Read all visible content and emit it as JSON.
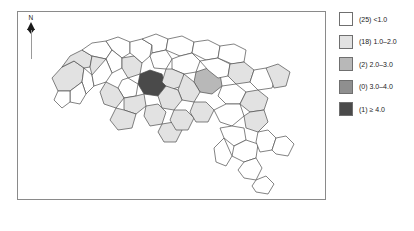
{
  "figure": {
    "type": "choropleth-map",
    "region": "South Carolina counties"
  },
  "north_arrow": {
    "label": "N",
    "icon": "north-arrow-icon"
  },
  "legend": {
    "position": "right",
    "rows": [
      {
        "count": "(25)",
        "range": "<1.0",
        "label": "(25) <1.0",
        "color": "#ffffff"
      },
      {
        "count": "(18)",
        "range": "1.0–2.0",
        "label": "(18) 1.0–2.0",
        "color": "#e2e2e2"
      },
      {
        "count": "(2)",
        "range": "2.0–3.0",
        "label": "(2) 2.0–3.0",
        "color": "#b8b8b8"
      },
      {
        "count": "(0)",
        "range": "3.0–4.0",
        "label": "(0) 3.0–4.0",
        "color": "#8f8f8f"
      },
      {
        "count": "(1)",
        "range": "≥ 4.0",
        "label": "(1) ≥ 4.0",
        "color": "#4a4a4a"
      }
    ]
  },
  "chart_data": {
    "type": "map",
    "title": "",
    "xlabel": "",
    "ylabel": "",
    "classes": [
      {
        "bin": "<1.0",
        "count": 25,
        "color": "#ffffff"
      },
      {
        "bin": "1.0–2.0",
        "count": 18,
        "color": "#e2e2e2"
      },
      {
        "bin": "2.0–3.0",
        "count": 2,
        "color": "#b8b8b8"
      },
      {
        "bin": "3.0–4.0",
        "count": 0,
        "color": "#8f8f8f"
      },
      {
        "bin": "≥ 4.0",
        "count": 1,
        "color": "#4a4a4a"
      }
    ],
    "total_units": 46,
    "legend_position": "right",
    "grid": false
  },
  "map": {
    "border_color": "#8a8a8a",
    "polygon_stroke": "#4d4d4d",
    "features": [
      {
        "id": "c01",
        "class": 1,
        "points": "34,66 44,55 56,49 66,56 64,70 52,79 40,79"
      },
      {
        "id": "c02",
        "class": 1,
        "points": "44,55 52,44 64,38 74,44 72,55 66,56 56,49"
      },
      {
        "id": "c03",
        "class": 0,
        "points": "64,38 74,31 88,29 94,38 88,47 74,44"
      },
      {
        "id": "c04",
        "class": 1,
        "points": "74,44 88,47 94,55 88,64 74,63 72,55"
      },
      {
        "id": "c05",
        "class": 0,
        "points": "66,56 74,63 76,74 68,82 64,70"
      },
      {
        "id": "c06",
        "class": 0,
        "points": "64,70 68,82 62,92 52,90 52,79"
      },
      {
        "id": "c07",
        "class": 0,
        "points": "52,79 52,90 44,96 36,88 40,79"
      },
      {
        "id": "c08",
        "class": 0,
        "points": "88,29 100,25 112,30 112,41 104,46 94,38"
      },
      {
        "id": "c09",
        "class": 0,
        "points": "94,38 104,46 104,56 94,61 88,47"
      },
      {
        "id": "c10",
        "class": 0,
        "points": "88,47 94,61 88,70 76,74 74,63"
      },
      {
        "id": "c11",
        "class": 1,
        "points": "104,46 116,44 124,51 122,62 110,66 104,56"
      },
      {
        "id": "c12",
        "class": 0,
        "points": "112,30 124,27 134,33 132,44 124,51 116,44 112,41"
      },
      {
        "id": "c13",
        "class": 0,
        "points": "124,27 138,22 150,27 148,38 134,41 134,33"
      },
      {
        "id": "c14",
        "class": 0,
        "points": "134,41 148,38 154,47 148,57 136,56 132,44"
      },
      {
        "id": "c15",
        "class": 4,
        "points": "122,62 132,58 144,62 148,74 140,84 126,82 120,72"
      },
      {
        "id": "c16",
        "class": 0,
        "points": "110,66 120,72 118,84 106,86 100,76 104,68"
      },
      {
        "id": "c17",
        "class": 1,
        "points": "88,70 100,76 106,86 98,96 86,92 82,80"
      },
      {
        "id": "c18",
        "class": 1,
        "points": "106,86 118,84 126,82 128,94 118,102 106,98"
      },
      {
        "id": "c19",
        "class": 1,
        "points": "98,96 106,98 118,102 114,116 100,118 92,108"
      },
      {
        "id": "c20",
        "class": 0,
        "points": "150,27 164,24 176,30 174,41 162,44 148,38"
      },
      {
        "id": "c21",
        "class": 0,
        "points": "162,44 174,41 182,49 178,60 166,62 154,57 154,47"
      },
      {
        "id": "c22",
        "class": 1,
        "points": "148,57 154,57 166,62 164,74 152,78 144,70"
      },
      {
        "id": "c23",
        "class": 2,
        "points": "178,60 190,56 202,62 204,74 194,82 182,80 176,70"
      },
      {
        "id": "c24",
        "class": 1,
        "points": "166,62 176,70 182,80 176,90 164,88 160,78"
      },
      {
        "id": "c25",
        "class": 1,
        "points": "148,74 160,78 164,88 156,98 144,96 140,84"
      },
      {
        "id": "c26",
        "class": 1,
        "points": "128,94 140,92 148,100 144,112 132,114 126,104"
      },
      {
        "id": "c27",
        "class": 1,
        "points": "144,112 156,110 164,118 158,130 146,130 140,120"
      },
      {
        "id": "c28",
        "class": 1,
        "points": "156,98 168,98 176,106 170,118 158,118 152,108"
      },
      {
        "id": "c29",
        "class": 1,
        "points": "176,90 188,90 196,98 190,110 178,110 172,100"
      },
      {
        "id": "c30",
        "class": 0,
        "points": "176,30 190,28 202,34 200,46 188,48 174,41"
      },
      {
        "id": "c31",
        "class": 0,
        "points": "188,48 200,46 212,52 210,64 200,66 190,58 182,49"
      },
      {
        "id": "c32",
        "class": 0,
        "points": "202,34 216,32 228,38 226,50 214,52 200,46"
      },
      {
        "id": "c33",
        "class": 1,
        "points": "212,52 226,50 236,58 232,70 218,72 210,64"
      },
      {
        "id": "c34",
        "class": 0,
        "points": "204,74 218,72 228,80 222,92 208,92 200,84"
      },
      {
        "id": "c35",
        "class": 1,
        "points": "228,80 240,78 250,86 246,98 232,100 222,92"
      },
      {
        "id": "c36",
        "class": 0,
        "points": "196,98 208,92 222,92 226,104 214,114 202,110"
      },
      {
        "id": "c37",
        "class": 1,
        "points": "226,104 232,100 246,98 250,110 240,120 228,116"
      },
      {
        "id": "c38",
        "class": 0,
        "points": "236,58 248,56 258,64 254,76 240,78 232,70"
      },
      {
        "id": "c39",
        "class": 1,
        "points": "248,56 260,52 272,60 268,74 256,76 254,70"
      },
      {
        "id": "c40",
        "class": 0,
        "points": "214,114 226,116 228,128 216,134 206,126 202,116"
      },
      {
        "id": "c41",
        "class": 0,
        "points": "216,134 228,128 240,132 238,146 226,150 214,144"
      },
      {
        "id": "c42",
        "class": 0,
        "points": "240,120 250,118 258,126 254,138 242,140 238,130"
      },
      {
        "id": "c43",
        "class": 0,
        "points": "226,150 238,146 244,156 238,168 226,166 220,158"
      },
      {
        "id": "c44",
        "class": 0,
        "points": "238,168 248,164 256,172 250,182 238,180 234,174"
      },
      {
        "id": "c45",
        "class": 0,
        "points": "206,126 214,144 208,154 198,150 196,136"
      },
      {
        "id": "c46",
        "class": 0,
        "points": "258,126 268,124 276,132 270,144 258,142 254,138"
      }
    ]
  }
}
